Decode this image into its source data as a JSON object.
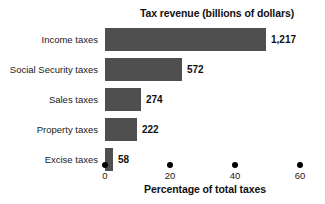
{
  "chart_data": {
    "type": "bar",
    "orientation": "horizontal",
    "title": "Tax revenue (billions of dollars)",
    "xlabel": "Percentage of total taxes",
    "ylabel": "",
    "categories": [
      "Income taxes",
      "Social Security taxes",
      "Sales taxes",
      "Property taxes",
      "Excise taxes"
    ],
    "values": [
      1217,
      572,
      274,
      222,
      58
    ],
    "value_labels": [
      "1,217",
      "572",
      "274",
      "222",
      "58"
    ],
    "bar_percentages": [
      49.5,
      23.7,
      11.1,
      9.9,
      2.4
    ],
    "xlim": [
      0,
      62
    ],
    "xticks": [
      0,
      20,
      40,
      60
    ],
    "xtick_labels": [
      "0",
      "20",
      "40",
      "60"
    ],
    "grid": false,
    "legend": false,
    "tick_marker_style": "dot",
    "bar_color": "#4f4f4f",
    "text_color": "#111111",
    "background_color": "#ffffff"
  },
  "layout": {
    "px_per_percent": 3.25,
    "plot_left_px": 105,
    "bar_height_px": 23,
    "bar_gap_px": 7
  }
}
